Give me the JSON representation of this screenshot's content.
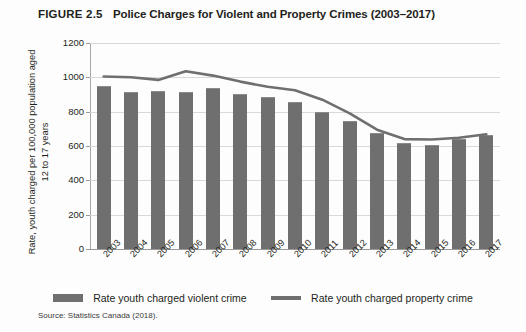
{
  "header": {
    "figure_label": "FIGURE 2.5",
    "title": "Police Charges for Violent and Property Crimes (2003–2017)"
  },
  "axis": {
    "y_title_line1": "Rate, youth charged per 100,000 population aged",
    "y_title_line2": "12 to 17 years"
  },
  "legend": {
    "bar_label": "Rate youth charged violent crime",
    "line_label": "Rate youth charged property crime"
  },
  "source": {
    "text": "Source: Statistics Canada (2018)."
  },
  "colors": {
    "bar": "#6f6f6f",
    "line": "#6f6f6f",
    "grid": "#d9d9d9",
    "text": "#231f20"
  },
  "chart_data": {
    "type": "bar",
    "title": "Police Charges for Violent and Property Crimes (2003–2017)",
    "xlabel": "",
    "ylabel": "Rate, youth charged per 100,000 population aged 12 to 17 years",
    "ylim": [
      0,
      1200
    ],
    "yticks": [
      0,
      200,
      400,
      600,
      800,
      1000,
      1200
    ],
    "grid": true,
    "legend_position": "bottom",
    "categories": [
      "2003",
      "2004",
      "2005",
      "2006",
      "2007",
      "2008",
      "2009",
      "2010",
      "2011",
      "2012",
      "2013",
      "2014",
      "2015",
      "2016",
      "2017"
    ],
    "series": [
      {
        "name": "Rate youth charged violent crime",
        "type": "bar",
        "values": [
          950,
          912,
          920,
          915,
          940,
          905,
          885,
          855,
          800,
          748,
          675,
          620,
          608,
          640,
          665
        ]
      },
      {
        "name": "Rate youth charged property crime",
        "type": "line",
        "values": [
          1005,
          1000,
          985,
          1035,
          1010,
          975,
          945,
          925,
          870,
          790,
          695,
          640,
          638,
          648,
          668
        ]
      }
    ]
  }
}
